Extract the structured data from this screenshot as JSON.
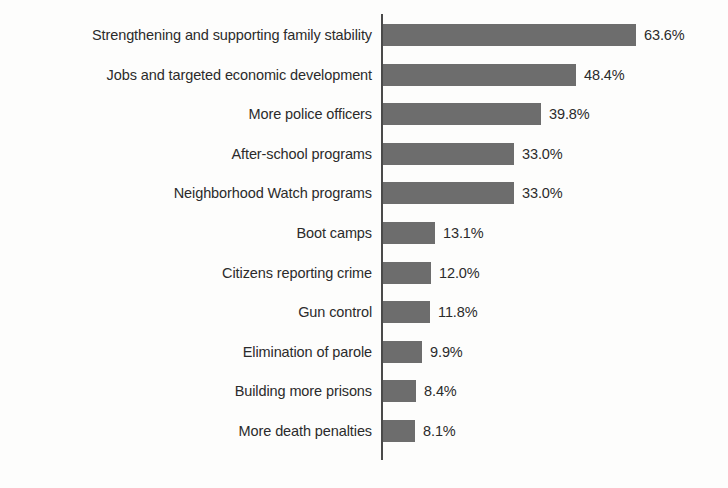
{
  "chart_data": {
    "type": "bar",
    "orientation": "horizontal",
    "title": "",
    "subtitle": "",
    "xlabel": "",
    "ylabel": "",
    "grid": false,
    "legend": null,
    "axis_range": [
      0,
      70
    ],
    "value_suffix": "%",
    "bar_color": "#6d6d6d",
    "text_color": "#2b2b2b",
    "axis_color": "#4a4a4a",
    "background_color": "#fdfdfc",
    "categories": [
      "Strengthening and supporting family stability",
      "Jobs and targeted economic development",
      "More police officers",
      "After-school programs",
      "Neighborhood Watch programs",
      "Boot camps",
      "Citizens reporting crime",
      "Gun control",
      "Elimination of parole",
      "Building more prisons",
      "More death penalties"
    ],
    "values": [
      63.6,
      48.4,
      39.8,
      33.0,
      33.0,
      13.1,
      12.0,
      11.8,
      9.9,
      8.4,
      8.1
    ],
    "value_labels": [
      "63.6%",
      "48.4%",
      "39.8%",
      "33.0%",
      "33.0%",
      "13.1%",
      "12.0%",
      "11.8%",
      "9.9%",
      "8.4%",
      "8.1%"
    ]
  }
}
